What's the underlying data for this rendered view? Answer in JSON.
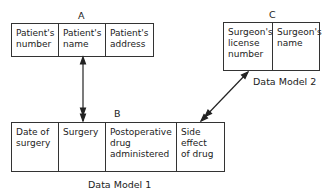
{
  "entity_a": {
    "label": "A",
    "fields": [
      "Patient's\nnumber",
      "Patient's\nname",
      "Patient's\naddress"
    ]
  },
  "entity_b": {
    "label": "B",
    "fields": [
      "Date of\nsurgery",
      "Surgery",
      "Postoperative\ndrug\nadministered",
      "Side\neffect\nof drug"
    ]
  },
  "entity_c": {
    "label": "C",
    "fields": [
      "Surgeon's\nlicense\nnumber",
      "Surgeon's\nname"
    ]
  },
  "captions": {
    "model1": "Data Model 1",
    "model2": "Data Model 2"
  },
  "relationships": [
    {
      "from": "A",
      "to": "B",
      "type": "one-to-many"
    },
    {
      "from": "C",
      "to": "B",
      "type": "one-to-many"
    }
  ]
}
